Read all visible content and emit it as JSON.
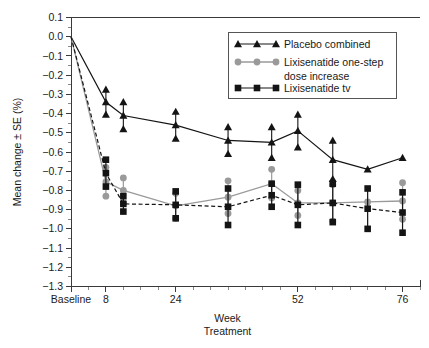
{
  "chart_data": {
    "type": "line",
    "title": "",
    "xlabel": "Week",
    "xlabel2": "Treatment",
    "ylabel": "Mean change ± SE (%)",
    "ylim": [
      -1.3,
      0.1
    ],
    "xlim": [
      0,
      80
    ],
    "grid": false,
    "legend_position": "top-right",
    "yticks": [
      "0.1",
      "0.0",
      "−0.1",
      "−0.2",
      "−0.3",
      "−0.4",
      "−0.5",
      "−0.6",
      "−0.7",
      "−0.8",
      "−0.9",
      "−1.0",
      "−1.1",
      "−1.2",
      "−1.3"
    ],
    "ytick_values": [
      0.1,
      0.0,
      -0.1,
      -0.2,
      -0.3,
      -0.4,
      -0.5,
      -0.6,
      -0.7,
      -0.8,
      -0.9,
      -1.0,
      -1.1,
      -1.2,
      -1.3
    ],
    "xticks": [
      "Baseline",
      "8",
      "24",
      "52",
      "76"
    ],
    "xtick_values": [
      0,
      8,
      24,
      52,
      76
    ],
    "xminor_values": [
      4,
      12,
      16,
      20,
      28,
      32,
      36,
      40,
      44,
      48,
      56,
      60,
      64,
      68,
      72,
      80
    ],
    "series": [
      {
        "name": "Placebo combined",
        "color": "#141414",
        "marker": "triangle",
        "linestyle": "solid",
        "x": [
          0,
          8,
          12,
          24,
          36,
          46,
          52,
          60,
          68,
          76
        ],
        "values": [
          0.0,
          -0.34,
          -0.41,
          -0.46,
          -0.54,
          -0.55,
          -0.49,
          -0.64,
          -0.69,
          -0.63
        ],
        "errors": [
          0.0,
          0.065,
          0.07,
          0.07,
          0.07,
          0.08,
          0.085,
          0.1,
          0.0,
          0.0
        ]
      },
      {
        "name": "Lixisenatide one-step dose increase",
        "color": "#9a9a9a",
        "marker": "circle",
        "linestyle": "solid",
        "x": [
          0,
          8,
          12,
          24,
          36,
          46,
          52,
          60,
          68,
          76
        ],
        "values": [
          0.0,
          -0.755,
          -0.8,
          -0.88,
          -0.835,
          -0.765,
          -0.865,
          -0.865,
          -0.86,
          -0.855
        ],
        "errors": [
          0.0,
          0.075,
          0.065,
          0.065,
          0.085,
          0.075,
          0.065,
          0.095,
          0.0,
          0.095
        ]
      },
      {
        "name": "Lixisenatide tv",
        "color": "#141414",
        "marker": "square",
        "linestyle": "dashed",
        "x": [
          0,
          8,
          12,
          24,
          36,
          46,
          52,
          60,
          68,
          76
        ],
        "values": [
          0.0,
          -0.71,
          -0.87,
          -0.875,
          -0.885,
          -0.825,
          -0.875,
          -0.865,
          -0.895,
          -0.915
        ],
        "errors": [
          0.0,
          0.07,
          0.04,
          0.07,
          0.095,
          0.06,
          0.105,
          0.1,
          0.105,
          0.105
        ]
      }
    ],
    "legend_entries": [
      {
        "label": "Placebo combined",
        "marker": "triangle",
        "color": "#141414",
        "dashed": false
      },
      {
        "label": "Lixisenatide one-step",
        "label2": "dose increase",
        "marker": "circle",
        "color": "#9a9a9a",
        "dashed": false
      },
      {
        "label": "Lixisenatide tv",
        "marker": "square",
        "color": "#141414",
        "dashed": false
      }
    ]
  }
}
